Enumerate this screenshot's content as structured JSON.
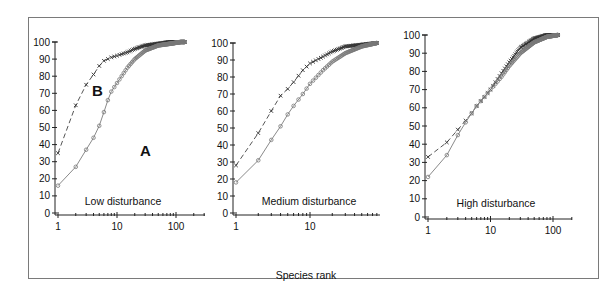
{
  "figure": {
    "x_axis_title": "Species rank",
    "frame_color": "#7a7a7a"
  },
  "chart_data": [
    {
      "type": "line",
      "title": "Low disturbance",
      "xlabel": "Species rank",
      "ylabel": "",
      "x_scale": "log",
      "xlim": [
        1,
        150
      ],
      "ylim": [
        0,
        100
      ],
      "x_ticks": [
        1,
        10,
        100
      ],
      "y_ticks": [
        0,
        10,
        20,
        30,
        40,
        50,
        60,
        70,
        80,
        90,
        100
      ],
      "grid": false,
      "annotations": [
        {
          "text": "B",
          "near_series": "B"
        },
        {
          "text": "A",
          "near_series": "A"
        }
      ],
      "series": [
        {
          "name": "B",
          "marker": "x",
          "line": "dashed",
          "color": "#555555",
          "x": [
            1,
            2,
            3,
            4,
            5,
            6,
            8,
            10,
            15,
            20,
            30,
            50,
            80,
            120,
            140
          ],
          "y": [
            35,
            63,
            75,
            81,
            86,
            89,
            91,
            92,
            94,
            96,
            98,
            99,
            100,
            100,
            100
          ]
        },
        {
          "name": "A",
          "marker": "o",
          "line": "solid",
          "color": "#8a8a8a",
          "x": [
            1,
            2,
            3,
            4,
            5,
            6,
            7,
            8,
            10,
            15,
            20,
            30,
            50,
            80,
            120,
            140
          ],
          "y": [
            16,
            27,
            37,
            44,
            51,
            59,
            66,
            71,
            76,
            85,
            90,
            95,
            98,
            99,
            100,
            100
          ]
        }
      ]
    },
    {
      "type": "line",
      "title": "Medium disturbance",
      "xlabel": "Species rank",
      "ylabel": "",
      "x_scale": "log",
      "xlim": [
        1,
        80
      ],
      "ylim": [
        0,
        100
      ],
      "x_ticks": [
        1,
        10
      ],
      "y_ticks": [
        0,
        10,
        20,
        30,
        40,
        50,
        60,
        70,
        80,
        90,
        100
      ],
      "grid": false,
      "series": [
        {
          "name": "B",
          "marker": "x",
          "line": "dashed",
          "color": "#555555",
          "x": [
            1,
            2,
            3,
            4,
            5,
            6,
            8,
            10,
            15,
            20,
            30,
            50,
            80
          ],
          "y": [
            28,
            47,
            60,
            69,
            73,
            77,
            84,
            88,
            92,
            95,
            98,
            99,
            100
          ]
        },
        {
          "name": "A",
          "marker": "o",
          "line": "solid",
          "color": "#8a8a8a",
          "x": [
            1,
            2,
            3,
            4,
            5,
            6,
            8,
            10,
            15,
            20,
            30,
            50,
            80
          ],
          "y": [
            18,
            31,
            43,
            51,
            58,
            63,
            70,
            76,
            84,
            89,
            94,
            98,
            100
          ]
        }
      ]
    },
    {
      "type": "line",
      "title": "High disturbance",
      "xlabel": "Species rank",
      "ylabel": "",
      "x_scale": "log",
      "xlim": [
        1,
        200
      ],
      "ylim": [
        0,
        100
      ],
      "x_ticks": [
        1,
        10,
        100
      ],
      "y_ticks": [
        0,
        10,
        20,
        30,
        40,
        50,
        60,
        70,
        80,
        90,
        100
      ],
      "grid": false,
      "series": [
        {
          "name": "B",
          "marker": "x",
          "line": "dashed",
          "color": "#555555",
          "x": [
            1,
            2,
            3,
            4,
            5,
            6,
            8,
            10,
            15,
            20,
            30,
            50,
            80,
            120
          ],
          "y": [
            33,
            41,
            48,
            53,
            57,
            61,
            66,
            70,
            79,
            85,
            93,
            98,
            100,
            100
          ]
        },
        {
          "name": "A",
          "marker": "o",
          "line": "solid",
          "color": "#8a8a8a",
          "x": [
            1,
            2,
            3,
            4,
            5,
            6,
            8,
            10,
            15,
            20,
            30,
            50,
            80,
            120
          ],
          "y": [
            22,
            34,
            45,
            52,
            57,
            61,
            66,
            70,
            77,
            83,
            90,
            96,
            99,
            100
          ]
        }
      ]
    }
  ]
}
